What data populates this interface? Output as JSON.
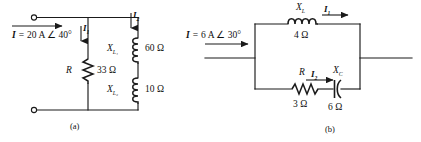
{
  "figure": {
    "panels": [
      {
        "caption": "(a)",
        "source": {
          "symbol": "I",
          "equals": "=",
          "value": "20 A",
          "angle_symbol": "∠",
          "angle": "40°"
        },
        "currents": [
          {
            "label": "I",
            "sub": "1"
          },
          {
            "label": "I",
            "sub": "2"
          }
        ],
        "components": [
          {
            "symbol": "R",
            "sub": "",
            "value": "33",
            "unit": "Ω"
          },
          {
            "symbol": "X",
            "sub": "L₁",
            "value": "60",
            "unit": "Ω"
          },
          {
            "symbol": "X",
            "sub": "L₂",
            "value": "10",
            "unit": "Ω"
          }
        ]
      },
      {
        "caption": "(b)",
        "source": {
          "symbol": "I",
          "equals": "=",
          "value": "6 A",
          "angle_symbol": "∠",
          "angle": "30°"
        },
        "currents": [
          {
            "label": "I",
            "sub": "1"
          },
          {
            "label": "I",
            "sub": "2"
          }
        ],
        "components": [
          {
            "symbol": "X",
            "sub": "L",
            "value": "4",
            "unit": "Ω"
          },
          {
            "symbol": "R",
            "sub": "",
            "value": "3",
            "unit": "Ω"
          },
          {
            "symbol": "X",
            "sub": "C",
            "value": "6",
            "unit": "Ω"
          }
        ]
      }
    ]
  },
  "panel_a": {
    "source_symbol": "I",
    "source_equals": "=",
    "source_value": "20 A ∠ 40°",
    "current_1": "I",
    "current_1_sub": "1",
    "current_2": "I",
    "current_2_sub": "2",
    "resistor_symbol": "R",
    "resistor_value": "33 Ω",
    "inductor1_symbol": "X",
    "inductor1_sub": "L₁",
    "inductor1_value": "60 Ω",
    "inductor2_symbol": "X",
    "inductor2_sub": "L₂",
    "inductor2_value": "10 Ω",
    "caption": "(a)"
  },
  "panel_b": {
    "source_symbol": "I",
    "source_equals": "=",
    "source_value": "6 A ∠ 30°",
    "current_1": "I",
    "current_1_sub": "1",
    "current_2": "I",
    "current_2_sub": "2",
    "inductor_symbol": "X",
    "inductor_sub": "L",
    "inductor_value": "4 Ω",
    "resistor_symbol": "R",
    "resistor_value": "3 Ω",
    "capacitor_symbol": "X",
    "capacitor_sub": "C",
    "capacitor_value": "6 Ω",
    "caption": "(b)"
  },
  "colors": {
    "wire": "#1a1a1a",
    "background": "#ffffff",
    "text": "#111111"
  }
}
